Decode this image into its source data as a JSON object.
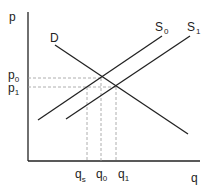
{
  "diagram": {
    "axes": {
      "y_label": "p",
      "x_label": "q"
    },
    "curves": [
      {
        "id": "D",
        "label": "D",
        "sub": ""
      },
      {
        "id": "S0",
        "label": "S",
        "sub": "0"
      },
      {
        "id": "S1",
        "label": "S",
        "sub": "1"
      }
    ],
    "price_ticks": [
      {
        "label": "p",
        "sub": "0"
      },
      {
        "label": "p",
        "sub": "1"
      }
    ],
    "quantity_ticks": [
      {
        "label": "q",
        "sub": "s"
      },
      {
        "label": "q",
        "sub": "0"
      },
      {
        "label": "q",
        "sub": "1"
      }
    ],
    "colors": {
      "line": "#222222",
      "dashed": "#999999"
    }
  }
}
